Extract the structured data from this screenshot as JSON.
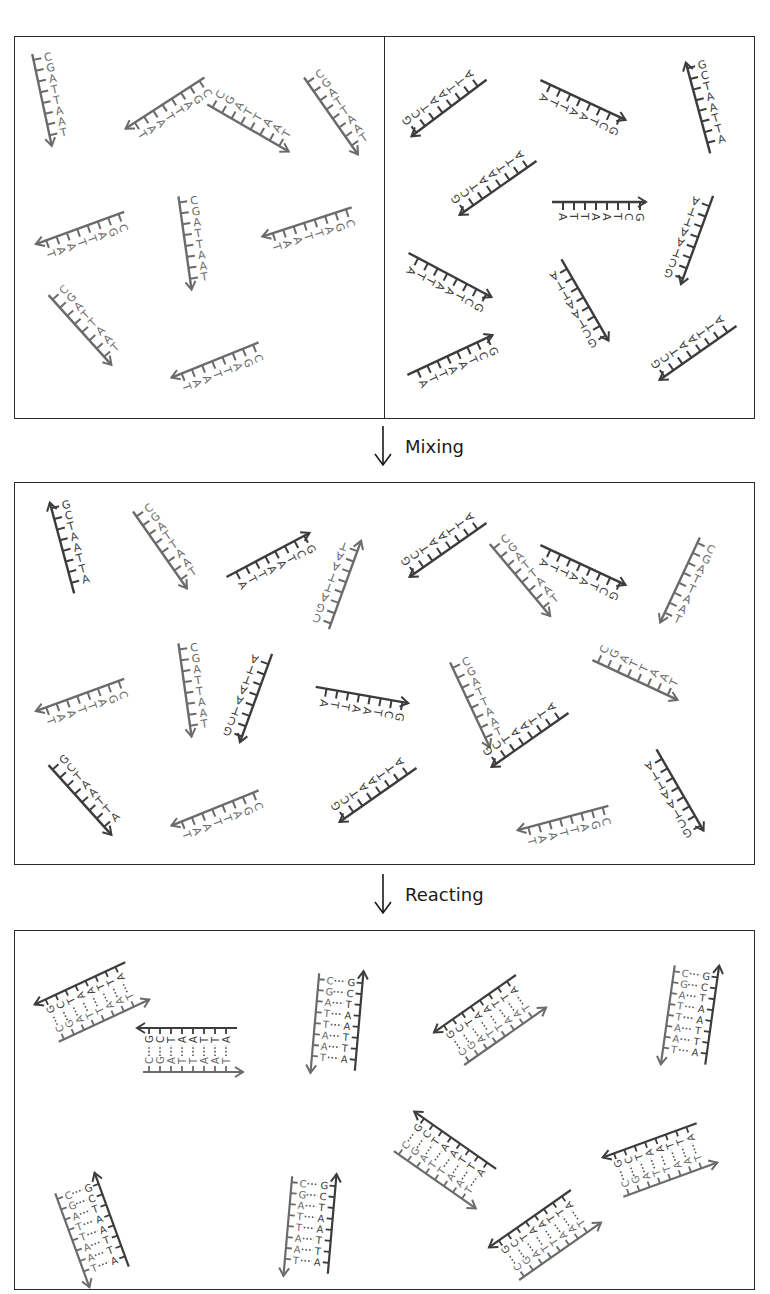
{
  "figure": {
    "colors": {
      "strand_a": "#6b6b6b",
      "strand_b": "#3c3c3c",
      "border": "#2a2a2a",
      "text": "#1a1a1a"
    }
  },
  "sequences": {
    "strand_a": [
      "C",
      "G",
      "A",
      "T",
      "T",
      "A",
      "A",
      "T"
    ],
    "strand_b": [
      "G",
      "C",
      "T",
      "A",
      "A",
      "T",
      "T",
      "A"
    ],
    "duplex_pairs": [
      {
        "left": "C",
        "right": "G"
      },
      {
        "left": "G",
        "right": "C"
      },
      {
        "left": "A",
        "right": "T"
      },
      {
        "left": "T",
        "right": "A"
      },
      {
        "left": "T",
        "right": "A"
      },
      {
        "left": "A",
        "right": "T"
      },
      {
        "left": "A",
        "right": "T"
      },
      {
        "left": "T",
        "right": "A"
      }
    ]
  },
  "panels": {
    "top": {
      "left_container": {
        "label": "Strand A solution",
        "strand": "strand_a",
        "count": 9
      },
      "right_container": {
        "label": "Strand B solution",
        "strand": "strand_b",
        "count": 9
      }
    },
    "middle": {
      "label": "Mixed single strands",
      "count": 18
    },
    "bottom": {
      "label": "Hybridized duplexes",
      "count": 9
    }
  },
  "steps": {
    "mixing": "Mixing",
    "reacting": "Reacting"
  }
}
